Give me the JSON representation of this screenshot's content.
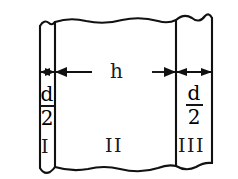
{
  "diagram": {
    "type": "engineering-cross-section",
    "stroke_color": "#111111",
    "background_color": "#ffffff",
    "dimensions": [
      {
        "name": "left-thickness",
        "numerator": "d",
        "denominator": "2",
        "display": "d/2"
      },
      {
        "name": "middle-thickness",
        "label": "h",
        "display": "h"
      },
      {
        "name": "right-thickness",
        "numerator": "d",
        "denominator": "2",
        "display": "d/2"
      }
    ],
    "regions": [
      {
        "name": "region-one",
        "label": "I"
      },
      {
        "name": "region-two",
        "label": "II"
      },
      {
        "name": "region-three",
        "label": "III"
      }
    ],
    "fraction_left": {
      "numerator": "d",
      "denominator": "2"
    },
    "fraction_right": {
      "numerator": "d",
      "denominator": "2"
    },
    "middle_label": "h",
    "break_lines": {
      "top": "wavy-break",
      "bottom": "wavy-break"
    }
  }
}
